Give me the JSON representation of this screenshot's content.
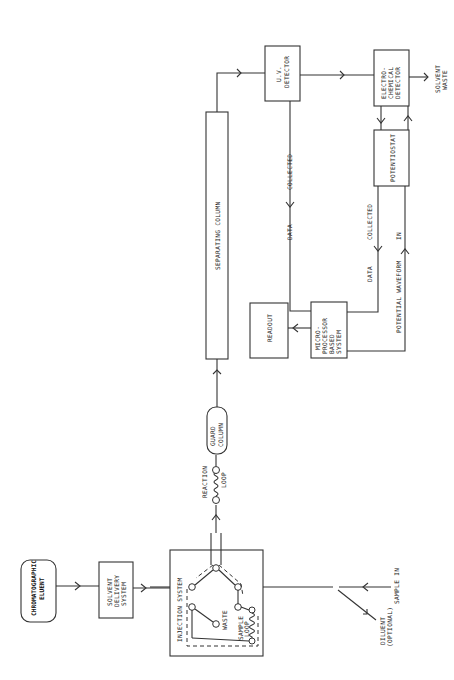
{
  "diagram": {
    "orientation": "rotated-90-ccw",
    "nodes": {
      "eluent": {
        "label_lines": [
          "CHROMATOGRAPHIC",
          "ELUENT"
        ]
      },
      "solvent_delivery": {
        "label_lines": [
          "SOLVENT",
          "DELIVERY",
          "SYSTEM"
        ]
      },
      "injection_system": {
        "label": "INJECTION  SYSTEM",
        "waste": "WASTE",
        "sample_loop_lines": [
          "SAMPLE",
          "LOOP"
        ]
      },
      "sample_in": {
        "label": "SAMPLE IN"
      },
      "diluent": {
        "label_lines": [
          "DILUENT",
          "(OPTIONAL)"
        ]
      },
      "reaction_loop": {
        "label_lines": [
          "REACTION",
          "LOOP"
        ]
      },
      "guard_column": {
        "label_lines": [
          "GUARD",
          "COLUMN"
        ]
      },
      "separating_column": {
        "label": "SEPARATING COLUMN"
      },
      "uv_detector": {
        "label_lines": [
          "U.V.",
          "DETECTOR"
        ]
      },
      "ec_detector": {
        "label_lines": [
          "ELECTRO-",
          "CHEMICAL",
          "DETECTOR"
        ]
      },
      "solvent_waste": {
        "label_lines": [
          "SOLVENT",
          "WASTE"
        ]
      },
      "potentiostat": {
        "label": "POTENTIOSTAT"
      },
      "microprocessor": {
        "label_lines": [
          "MICRO-",
          "PROCESSOR",
          "BASED",
          "SYSTEM"
        ]
      },
      "readout": {
        "label": "READOUT"
      }
    },
    "edge_labels": {
      "uv_to_micro": {
        "a": "DATA",
        "b": "COLLECTED"
      },
      "pot_to_micro": {
        "a": "DATA",
        "b": "COLLECTED"
      },
      "micro_to_pot": {
        "a": "POTENTIAL WAVEFORM",
        "b": "IN"
      }
    }
  }
}
